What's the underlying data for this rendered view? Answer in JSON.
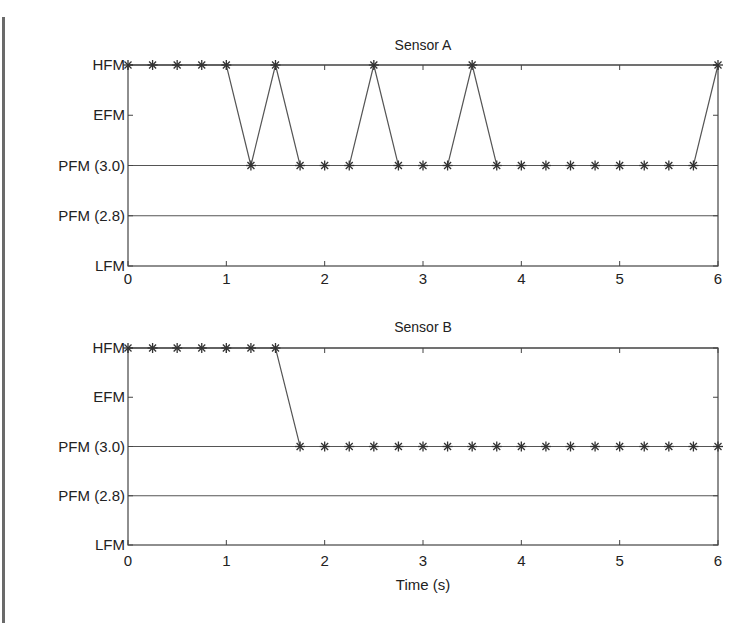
{
  "chart_data": [
    {
      "type": "line",
      "title": "Sensor A",
      "xlabel": "",
      "ylabel": "",
      "xlim": [
        0,
        6
      ],
      "x_ticks": [
        "0",
        "1",
        "2",
        "3",
        "4",
        "5",
        "6"
      ],
      "y_categories": [
        "LFM",
        "PFM (2.8)",
        "PFM (3.0)",
        "EFM",
        "HFM"
      ],
      "grid": false,
      "reference_lines": [
        "HFM",
        "PFM (3.0)",
        "PFM (2.8)"
      ],
      "marker": "asterisk",
      "x": [
        0,
        0.25,
        0.5,
        0.75,
        1,
        1.25,
        1.5,
        1.75,
        2,
        2.25,
        2.5,
        2.75,
        3,
        3.25,
        3.5,
        3.75,
        4,
        4.25,
        4.5,
        4.75,
        5,
        5.25,
        5.5,
        5.75,
        6
      ],
      "values": [
        "HFM",
        "HFM",
        "HFM",
        "HFM",
        "HFM",
        "PFM (3.0)",
        "HFM",
        "PFM (3.0)",
        "PFM (3.0)",
        "PFM (3.0)",
        "HFM",
        "PFM (3.0)",
        "PFM (3.0)",
        "PFM (3.0)",
        "HFM",
        "PFM (3.0)",
        "PFM (3.0)",
        "PFM (3.0)",
        "PFM (3.0)",
        "PFM (3.0)",
        "PFM (3.0)",
        "PFM (3.0)",
        "PFM (3.0)",
        "PFM (3.0)",
        "HFM"
      ]
    },
    {
      "type": "line",
      "title": "Sensor B",
      "xlabel": "Time (s)",
      "ylabel": "",
      "xlim": [
        0,
        6
      ],
      "x_ticks": [
        "0",
        "1",
        "2",
        "3",
        "4",
        "5",
        "6"
      ],
      "y_categories": [
        "LFM",
        "PFM (2.8)",
        "PFM (3.0)",
        "EFM",
        "HFM"
      ],
      "grid": false,
      "reference_lines": [
        "HFM",
        "PFM (3.0)",
        "PFM (2.8)"
      ],
      "marker": "asterisk",
      "x": [
        0,
        0.25,
        0.5,
        0.75,
        1,
        1.25,
        1.5,
        1.75,
        2,
        2.25,
        2.5,
        2.75,
        3,
        3.25,
        3.5,
        3.75,
        4,
        4.25,
        4.5,
        4.75,
        5,
        5.25,
        5.5,
        5.75,
        6
      ],
      "values": [
        "HFM",
        "HFM",
        "HFM",
        "HFM",
        "HFM",
        "HFM",
        "HFM",
        "PFM (3.0)",
        "PFM (3.0)",
        "PFM (3.0)",
        "PFM (3.0)",
        "PFM (3.0)",
        "PFM (3.0)",
        "PFM (3.0)",
        "PFM (3.0)",
        "PFM (3.0)",
        "PFM (3.0)",
        "PFM (3.0)",
        "PFM (3.0)",
        "PFM (3.0)",
        "PFM (3.0)",
        "PFM (3.0)",
        "PFM (3.0)",
        "PFM (3.0)",
        "PFM (3.0)"
      ]
    }
  ],
  "colors": {
    "line": "#555555",
    "axis": "#444444",
    "text": "#222222"
  }
}
